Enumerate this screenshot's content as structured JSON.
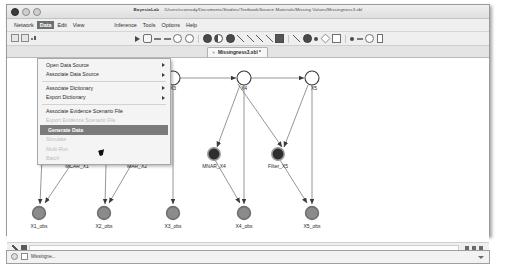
{
  "window": {
    "app_name": "BayesiaLab",
    "file_path": "/Users/sconrady/Documents/Studies/Textbook/Source Materials/Missing Values/Missingness3.xbl",
    "traffic_lights": [
      "close",
      "minimize",
      "zoom"
    ]
  },
  "menubar": {
    "items": [
      {
        "label": "Network",
        "selected": false
      },
      {
        "label": "Data",
        "selected": true
      },
      {
        "label": "Edit",
        "selected": false
      },
      {
        "label": "View",
        "selected": false
      },
      {
        "label": "Inference",
        "selected": false
      },
      {
        "label": "Tools",
        "selected": false
      },
      {
        "label": "Options",
        "selected": false
      },
      {
        "label": "Help",
        "selected": false
      }
    ]
  },
  "data_menu": {
    "items": [
      {
        "label": "Open Data Source",
        "submenu": true,
        "disabled": false,
        "highlighted": false
      },
      {
        "label": "Associate Data Source",
        "submenu": true,
        "disabled": false,
        "highlighted": false
      },
      {
        "separator_after": true
      },
      {
        "label": "Associate Dictionary",
        "submenu": true,
        "disabled": false,
        "highlighted": false
      },
      {
        "label": "Export Dictionary",
        "submenu": true,
        "disabled": false,
        "highlighted": false
      },
      {
        "separator_after": true
      },
      {
        "label": "Associate Evidence Scenario File",
        "submenu": false,
        "disabled": false,
        "highlighted": false
      },
      {
        "label": "Export Evidence Scenario File",
        "submenu": false,
        "disabled": true,
        "highlighted": false
      },
      {
        "label": "Generate Data",
        "submenu": false,
        "disabled": false,
        "highlighted": true
      },
      {
        "label": "Simulate",
        "submenu": false,
        "disabled": true,
        "highlighted": false
      },
      {
        "label": "Multi-Run",
        "submenu": false,
        "disabled": true,
        "highlighted": false
      },
      {
        "label": "Batch",
        "submenu": false,
        "disabled": true,
        "highlighted": false
      }
    ]
  },
  "toolbar": {
    "left_icons": [
      "new-document-icon",
      "open-folder-icon",
      "chart-icon"
    ],
    "main_icons": [
      "run-icon",
      "grid-icon",
      "align-left-icon",
      "align-center-icon",
      "refresh-icon",
      "undo-icon",
      "node-circle-icon",
      "node-pair-icon",
      "node-filled-icon",
      "arrow-link-icon",
      "curve-link-icon",
      "erase-link-icon",
      "diagonal-line-icon",
      "eraser-icon",
      "cursor-select-icon",
      "target-icon",
      "small-node-icon",
      "diamond-node-icon",
      "square-node-icon",
      "dot-icon",
      "bar-icon",
      "ring-icon",
      "bracket-icon"
    ]
  },
  "document_tab": {
    "label": "Missingness3.xbl *",
    "close_icon": "close-icon"
  },
  "graph": {
    "title": "Missingness Bayesian network",
    "nodes": [
      {
        "id": "X1",
        "label": "X1",
        "x": 38,
        "y": 20,
        "type": "latent"
      },
      {
        "id": "X2",
        "label": "X2",
        "x": 101,
        "y": 20,
        "type": "latent"
      },
      {
        "id": "X3",
        "label": "X3",
        "x": 166,
        "y": 20,
        "type": "latent"
      },
      {
        "id": "X4",
        "label": "X4",
        "x": 237,
        "y": 20,
        "type": "latent"
      },
      {
        "id": "X5",
        "label": "X5",
        "x": 305,
        "y": 20,
        "type": "latent"
      },
      {
        "id": "MCAR_X1",
        "label": "MCAR_X1",
        "x": 70,
        "y": 96,
        "type": "mechanism"
      },
      {
        "id": "MAR_X2",
        "label": "MAR_X2",
        "x": 130,
        "y": 96,
        "type": "mechanism"
      },
      {
        "id": "MNAR_X4",
        "label": "MNAR_X4",
        "x": 207,
        "y": 96,
        "type": "mechanism"
      },
      {
        "id": "Filter_X5",
        "label": "Filter_X5",
        "x": 271,
        "y": 96,
        "type": "mechanism"
      },
      {
        "id": "X1_obs",
        "label": "X1_obs",
        "x": 32,
        "y": 155,
        "type": "observed"
      },
      {
        "id": "X2_obs",
        "label": "X2_obs",
        "x": 97,
        "y": 155,
        "type": "observed"
      },
      {
        "id": "X3_obs",
        "label": "X3_obs",
        "x": 166,
        "y": 155,
        "type": "observed"
      },
      {
        "id": "X4_obs",
        "label": "X4_obs",
        "x": 237,
        "y": 155,
        "type": "observed"
      },
      {
        "id": "X5_obs",
        "label": "X5_obs",
        "x": 305,
        "y": 155,
        "type": "observed"
      }
    ],
    "edges": [
      {
        "from": "X1",
        "to": "X2"
      },
      {
        "from": "X2",
        "to": "X3"
      },
      {
        "from": "X3",
        "to": "X4"
      },
      {
        "from": "X4",
        "to": "X5"
      },
      {
        "from": "X1",
        "to": "X1_obs"
      },
      {
        "from": "X2",
        "to": "X2_obs"
      },
      {
        "from": "X3",
        "to": "X3_obs"
      },
      {
        "from": "X4",
        "to": "X4_obs"
      },
      {
        "from": "X5",
        "to": "X5_obs"
      },
      {
        "from": "MCAR_X1",
        "to": "X1_obs"
      },
      {
        "from": "MAR_X2",
        "to": "X2_obs"
      },
      {
        "from": "MNAR_X4",
        "to": "X4_obs"
      },
      {
        "from": "Filter_X5",
        "to": "X5_obs"
      },
      {
        "from": "X1",
        "to": "MAR_X2"
      },
      {
        "from": "X4",
        "to": "MNAR_X4"
      },
      {
        "from": "X5",
        "to": "Filter_X5"
      },
      {
        "from": "X4",
        "to": "Filter_X5"
      }
    ],
    "colors": {
      "latent_fill": "#ffffff",
      "latent_stroke": "#3a3a3a",
      "mechanism_fill": "#2e2e2e",
      "mechanism_ring": "#8f8f8f",
      "observed_fill": "#8b8b8b",
      "observed_ring": "#7a7a7a",
      "edge": "#6b6b6b"
    }
  },
  "statusbar": {
    "left_icons": [
      "pencil-icon",
      "flag-icon",
      "dot-icon"
    ],
    "right_icons": [
      "dots-icon",
      "zoom-icon",
      "resize-grip-icon"
    ],
    "message": ""
  },
  "taskbar": {
    "item_label": "Missingne...",
    "caret_icon": "chevron-down-icon"
  }
}
